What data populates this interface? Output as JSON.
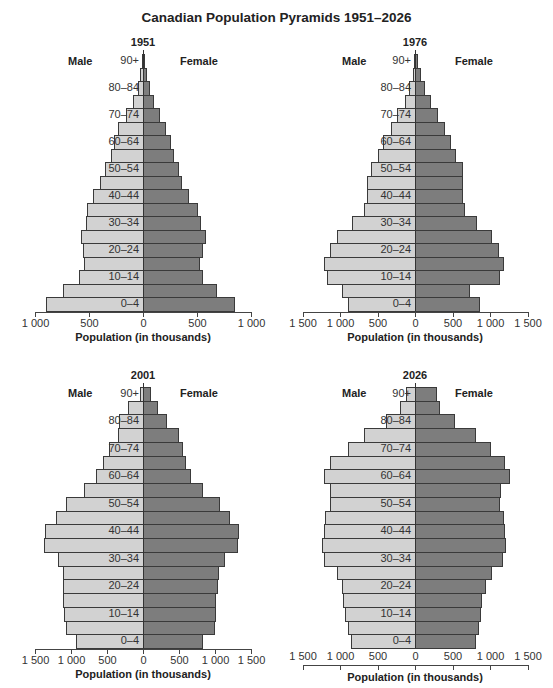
{
  "title": "Canadian Population Pyramids 1951–2026",
  "colors": {
    "male": "#d2d2d2",
    "female": "#7d7d7d",
    "border": "#3a3a3a"
  },
  "labels": {
    "male": "Male",
    "female": "Female",
    "xlabel": "Population (in thousands)"
  },
  "chart_data": [
    {
      "type": "bar",
      "orientation": "horizontal-population-pyramid",
      "title": "1951",
      "xlabel": "Population (in thousands)",
      "xlim": [
        -1000,
        1000
      ],
      "x_ticks": [
        "1 000",
        "500",
        "0",
        "500",
        "1 000"
      ],
      "age_groups": [
        "0–4",
        "5–9",
        "10–14",
        "15–19",
        "20–24",
        "25–29",
        "30–34",
        "35–39",
        "40–44",
        "45–49",
        "50–54",
        "55–59",
        "60–64",
        "65–69",
        "70–74",
        "75–79",
        "80–84",
        "85–89",
        "90+"
      ],
      "labeled_age_groups": [
        "0–4",
        "10–14",
        "20–24",
        "30–34",
        "40–44",
        "50–54",
        "60–64",
        "70–74",
        "80–84",
        "90+"
      ],
      "series": [
        {
          "name": "Male",
          "values": [
            900,
            740,
            595,
            550,
            555,
            575,
            530,
            520,
            465,
            400,
            350,
            295,
            265,
            235,
            155,
            95,
            50,
            25,
            10
          ]
        },
        {
          "name": "Female",
          "values": [
            850,
            685,
            555,
            530,
            555,
            585,
            535,
            505,
            430,
            360,
            330,
            290,
            255,
            215,
            160,
            105,
            65,
            40,
            15
          ]
        }
      ]
    },
    {
      "type": "bar",
      "orientation": "horizontal-population-pyramid",
      "title": "1976",
      "xlabel": "Population (in thousands)",
      "xlim": [
        -1500,
        1500
      ],
      "x_ticks": [
        "1 500",
        "1 000",
        "500",
        "0",
        "500",
        "1 000",
        "1 500"
      ],
      "age_groups": [
        "0–4",
        "5–9",
        "10–14",
        "15–19",
        "20–24",
        "25–29",
        "30–34",
        "35–39",
        "40–44",
        "45–49",
        "50–54",
        "55–59",
        "60–64",
        "65–69",
        "70–74",
        "75–79",
        "80–84",
        "85–89",
        "90+"
      ],
      "labeled_age_groups": [
        "0–4",
        "10–14",
        "20–24",
        "30–34",
        "40–44",
        "50–54",
        "60–64",
        "70–74",
        "80–84",
        "90+"
      ],
      "series": [
        {
          "name": "Male",
          "values": [
            900,
            980,
            1170,
            1220,
            1130,
            1035,
            845,
            680,
            645,
            635,
            590,
            490,
            430,
            325,
            235,
            140,
            75,
            25,
            10
          ]
        },
        {
          "name": "Female",
          "values": [
            865,
            735,
            1135,
            1185,
            1125,
            1020,
            820,
            670,
            635,
            635,
            635,
            540,
            480,
            395,
            310,
            210,
            135,
            85,
            45
          ]
        }
      ]
    },
    {
      "type": "bar",
      "orientation": "horizontal-population-pyramid",
      "title": "2001",
      "xlabel": "Population (in thousands)",
      "xlim": [
        -1500,
        1500
      ],
      "x_ticks": [
        "1 500",
        "1 000",
        "500",
        "0",
        "500",
        "1 000",
        "1 500"
      ],
      "age_groups": [
        "0–4",
        "5–9",
        "10–14",
        "15–19",
        "20–24",
        "25–29",
        "30–34",
        "35–39",
        "40–44",
        "45–49",
        "50–54",
        "55–59",
        "60–64",
        "65–69",
        "70–74",
        "75–79",
        "80–84",
        "85–89",
        "90+"
      ],
      "labeled_age_groups": [
        "0–4",
        "10–14",
        "20–24",
        "30–34",
        "40–44",
        "50–54",
        "60–64",
        "70–74",
        "80–84",
        "90+"
      ],
      "series": [
        {
          "name": "Male",
          "values": [
            935,
            1075,
            1095,
            1105,
            1110,
            1105,
            1180,
            1380,
            1360,
            1215,
            1075,
            825,
            655,
            560,
            475,
            350,
            330,
            210,
            40
          ]
        },
        {
          "name": "Female",
          "values": [
            835,
            995,
            1015,
            1015,
            1040,
            1060,
            1135,
            1325,
            1340,
            1210,
            1070,
            840,
            670,
            595,
            555,
            495,
            335,
            210,
            115
          ]
        }
      ]
    },
    {
      "type": "bar",
      "orientation": "horizontal-population-pyramid",
      "title": "2026",
      "xlabel": "Population (in thousands)",
      "xlim": [
        -1500,
        1500
      ],
      "x_ticks": [
        "1 500",
        "1 000",
        "500",
        "0",
        "500",
        "1 000",
        "1 500"
      ],
      "age_groups": [
        "0–4",
        "5–9",
        "10–14",
        "15–19",
        "20–24",
        "25–29",
        "30–34",
        "35–39",
        "40–44",
        "45–49",
        "50–54",
        "55–59",
        "60–64",
        "65–69",
        "70–74",
        "75–79",
        "80–84",
        "85–89",
        "90+"
      ],
      "labeled_age_groups": [
        "0–4",
        "10–14",
        "20–24",
        "30–34",
        "40–44",
        "50–54",
        "60–64",
        "70–74",
        "80–84",
        "90+"
      ],
      "series": [
        {
          "name": "Male",
          "values": [
            860,
            900,
            930,
            955,
            975,
            1040,
            1210,
            1235,
            1220,
            1195,
            1140,
            1130,
            1220,
            1135,
            900,
            680,
            390,
            195,
            120
          ]
        },
        {
          "name": "Female",
          "values": [
            815,
            850,
            875,
            890,
            940,
            1020,
            1170,
            1210,
            1195,
            1180,
            1135,
            1140,
            1260,
            1200,
            1010,
            810,
            530,
            330,
            290
          ]
        }
      ]
    }
  ]
}
